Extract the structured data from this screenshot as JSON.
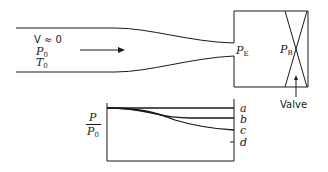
{
  "nozzle": {
    "inlet_velocity": "V ≈ 0",
    "stagnation_pressure": {
      "symbol": "P",
      "sub": "0"
    },
    "stagnation_temperature": {
      "symbol": "T",
      "sub": "0"
    },
    "exit_pressure": {
      "symbol": "P",
      "sub": "E"
    },
    "back_pressure": {
      "symbol": "P",
      "sub": "B"
    },
    "valve_label": "Valve"
  },
  "plot": {
    "ylabel_num": "P",
    "ylabel_den": {
      "symbol": "P",
      "sub": "0"
    },
    "curves": [
      "a",
      "b",
      "c",
      "d"
    ]
  },
  "colors": {
    "ink": "#1a1a1a",
    "background": "#ffffff"
  }
}
